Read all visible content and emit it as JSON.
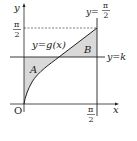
{
  "diagram": {
    "axes": {
      "x_label": "x",
      "y_label": "y",
      "origin_label": "O"
    },
    "curve_label": "y=g(x)",
    "horizontal_line_label": "y=k",
    "vertical_line_label_prefix": "y=",
    "pi_numerator": "π",
    "pi_denominator": "2",
    "region_a_label": "A",
    "region_b_label": "B",
    "colors": {
      "line": "#222222",
      "shade": "#d9d9d9",
      "dashed": "#444444"
    }
  }
}
